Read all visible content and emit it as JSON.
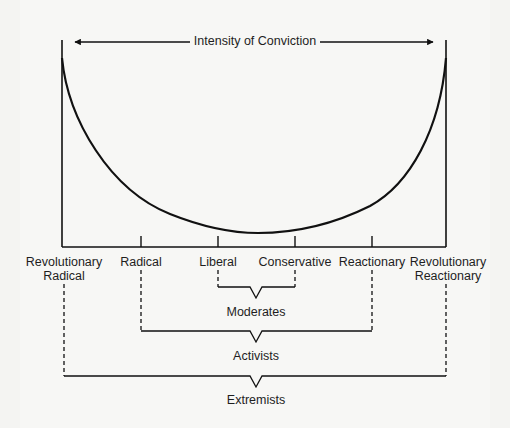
{
  "diagram": {
    "axis_title": "Intensity of Conviction",
    "positions": [
      {
        "id": "revolutionary-radical",
        "label_line1": "Revolutionary",
        "label_line2": "Radical"
      },
      {
        "id": "radical",
        "label_line1": "Radical"
      },
      {
        "id": "liberal",
        "label_line1": "Liberal"
      },
      {
        "id": "conservative",
        "label_line1": "Conservative"
      },
      {
        "id": "reactionary",
        "label_line1": "Reactionary"
      },
      {
        "id": "revolutionary-reactionary",
        "label_line1": "Revolutionary",
        "label_line2": "Reactionary"
      }
    ],
    "groups": [
      {
        "id": "moderates",
        "label": "Moderates",
        "spans": [
          "liberal",
          "conservative"
        ]
      },
      {
        "id": "activists",
        "label": "Activists",
        "spans": [
          "radical",
          "reactionary"
        ]
      },
      {
        "id": "extremists",
        "label": "Extremists",
        "spans": [
          "revolutionary-radical",
          "revolutionary-reactionary"
        ]
      }
    ],
    "curve": "U-shaped curve: intensity of conviction high at extremes, lowest between Liberal and Conservative"
  }
}
